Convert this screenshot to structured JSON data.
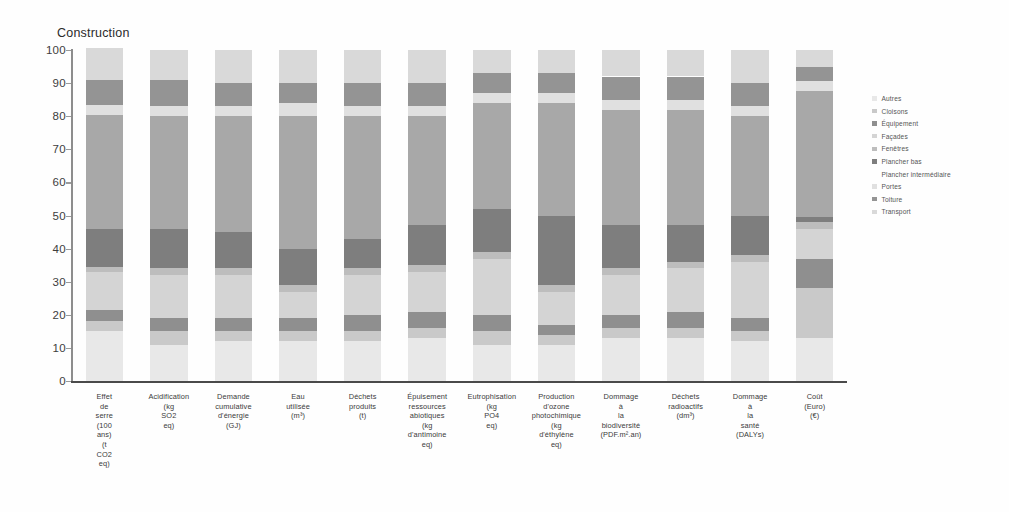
{
  "chart_data": {
    "type": "bar",
    "subtype": "stacked-100-percent",
    "title": "Construction",
    "xlabel": "",
    "ylabel": "",
    "ylim": [
      0,
      100
    ],
    "yticks": [
      0,
      10,
      20,
      30,
      40,
      50,
      60,
      70,
      80,
      90,
      100
    ],
    "grid": false,
    "legend_position": "right",
    "categories": [
      "Effet de serre (100 ans) (t CO2 eq)",
      "Acidification (kg SO2 eq)",
      "Demande cumulative d'énergie (GJ)",
      "Eau utilisée (m³)",
      "Déchets produits (t)",
      "Épuisement ressources abiotiques (kg d'antimoine eq)",
      "Eutrophisation (kg PO4 eq)",
      "Production d'ozone photochimique (kg d'éthylène eq)",
      "Dommage à la biodiversité (PDF.m².an)",
      "Déchets radioactifs (dm³)",
      "Dommage à la santé (DALYs)",
      "Coût (Euro) (€)"
    ],
    "category_lines": [
      [
        "Effet",
        "de",
        "serre",
        "(100",
        "ans)",
        "(t",
        "CO2",
        "eq)"
      ],
      [
        "Acidification",
        "(kg",
        "SO2",
        "eq)"
      ],
      [
        "Demande",
        "cumulative",
        "d'énergie",
        "(GJ)"
      ],
      [
        "Eau",
        "utilisée",
        "(m³)"
      ],
      [
        "Déchets",
        "produits",
        "(t)"
      ],
      [
        "Épuisement",
        "ressources",
        "abiotiques",
        "(kg",
        "d'antimoine",
        "eq)"
      ],
      [
        "Eutrophisation",
        "(kg",
        "PO4",
        "eq)"
      ],
      [
        "Production",
        "d'ozone",
        "photochimique",
        "(kg",
        "d'éthylène",
        "eq)"
      ],
      [
        "Dommage",
        "à",
        "la",
        "biodiversité",
        "(PDF.m².an)"
      ],
      [
        "Déchets",
        "radioactifs",
        "(dm³)"
      ],
      [
        "Dommage",
        "à",
        "la",
        "santé",
        "(DALYs)"
      ],
      [
        "Coût",
        "(Euro)",
        "(€)"
      ]
    ],
    "series": [
      {
        "name": "Autres",
        "color": "#e8e8e8",
        "values": [
          15.0,
          11.0,
          12.0,
          12.0,
          12.0,
          13.0,
          11.0,
          11.0,
          13.0,
          13.0,
          12.0,
          13.0
        ]
      },
      {
        "name": "Cloisons",
        "color": "#c9c9c9",
        "values": [
          3.0,
          4.0,
          3.0,
          3.0,
          3.0,
          3.0,
          4.0,
          3.0,
          3.0,
          3.0,
          3.0,
          15.0
        ]
      },
      {
        "name": "Équipement",
        "color": "#8f8f8f",
        "values": [
          3.5,
          4.0,
          4.0,
          4.0,
          5.0,
          5.0,
          5.0,
          3.0,
          4.0,
          5.0,
          4.0,
          9.0
        ]
      },
      {
        "name": "Façades",
        "color": "#d4d4d4",
        "values": [
          11.5,
          13.0,
          13.0,
          8.0,
          12.0,
          12.0,
          17.0,
          10.0,
          12.0,
          13.0,
          17.0,
          9.0
        ]
      },
      {
        "name": "Fenêtres",
        "color": "#bdbdbd",
        "values": [
          1.5,
          2.0,
          2.0,
          2.0,
          2.0,
          2.0,
          2.0,
          2.0,
          2.0,
          2.0,
          2.0,
          2.0
        ]
      },
      {
        "name": "Plancher bas",
        "color": "#7e7e7e",
        "values": [
          11.5,
          12.0,
          11.0,
          11.0,
          9.0,
          12.0,
          13.0,
          21.0,
          13.0,
          11.0,
          12.0,
          1.5
        ]
      },
      {
        "name": "Plancher intermédiaire",
        "color": "#a8a8a8",
        "values": [
          34.5,
          34.0,
          35.0,
          40.0,
          37.0,
          33.0,
          32.0,
          34.0,
          35.0,
          35.0,
          30.0,
          38.0
        ]
      },
      {
        "name": "Portes",
        "color": "#e0e0e0",
        "values": [
          3.0,
          3.0,
          3.0,
          4.0,
          3.0,
          3.0,
          3.0,
          3.0,
          3.0,
          3.0,
          3.0,
          3.0
        ]
      },
      {
        "name": "Toiture",
        "color": "#949494",
        "values": [
          7.5,
          8.0,
          7.0,
          6.0,
          7.0,
          7.0,
          6.0,
          6.0,
          7.0,
          7.0,
          7.0,
          4.5
        ]
      },
      {
        "name": "Transport",
        "color": "#d9d9d9",
        "values": [
          9.5,
          9.0,
          10.0,
          10.0,
          10.0,
          10.0,
          7.0,
          7.0,
          8.0,
          8.0,
          10.0,
          5.0
        ]
      }
    ]
  },
  "legend": {
    "items": [
      {
        "label": "Autres",
        "marked": true
      },
      {
        "label": "Cloisons",
        "marked": true
      },
      {
        "label": "Équipement",
        "marked": true
      },
      {
        "label": "Façades",
        "marked": true
      },
      {
        "label": "Fenêtres",
        "marked": true
      },
      {
        "label": "Plancher bas",
        "marked": true
      },
      {
        "label": "Plancher intermédiaire",
        "marked": false
      },
      {
        "label": "Portes",
        "marked": true
      },
      {
        "label": "Toiture",
        "marked": true
      },
      {
        "label": "Transport",
        "marked": true
      }
    ]
  }
}
